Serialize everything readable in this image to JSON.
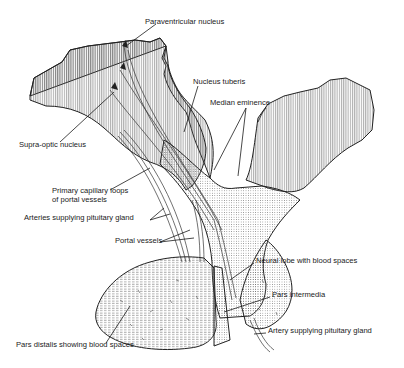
{
  "figure": {
    "labels": [
      {
        "id": "paraventricular",
        "text": "Paraventricular nucleus",
        "x": 145,
        "y": 24
      },
      {
        "id": "nucleus-tuberis",
        "text": "Nucleus tuberis",
        "x": 193,
        "y": 84
      },
      {
        "id": "median-eminence",
        "text": "Median eminence",
        "x": 210,
        "y": 105
      },
      {
        "id": "supra-optic",
        "text": "Supra-optic nucleus",
        "x": 19,
        "y": 147
      },
      {
        "id": "primary-capillary-1",
        "text": "Primary capillary loops",
        "x": 52,
        "y": 193
      },
      {
        "id": "primary-capillary-2",
        "text": "of portal vessels",
        "x": 52,
        "y": 202
      },
      {
        "id": "arteries-supplying",
        "text": "Arteries supplying pituitary gland",
        "x": 24,
        "y": 220
      },
      {
        "id": "portal-vessels",
        "text": "Portal vessels",
        "x": 115,
        "y": 243
      },
      {
        "id": "neural-lobe",
        "text": "Neural lobe with blood spaces",
        "x": 256,
        "y": 263
      },
      {
        "id": "pars-intermedia",
        "text": "Pars intermedia",
        "x": 272,
        "y": 297
      },
      {
        "id": "artery-supplying",
        "text": "Artery supplying pituitary gland",
        "x": 268,
        "y": 333
      },
      {
        "id": "pars-distalis",
        "text": "Pars distalis showing blood spaces",
        "x": 16,
        "y": 347
      }
    ]
  }
}
